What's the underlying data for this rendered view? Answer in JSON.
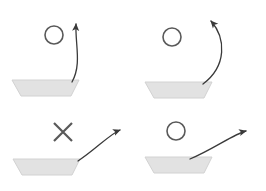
{
  "figure": {
    "title": "",
    "background_color": "#ffffff",
    "width": 266,
    "height": 191,
    "layout": "2x2-grid",
    "panel_count": 4
  },
  "style": {
    "bowl_fill": "#e2e2e2",
    "bowl_edge": "#d2d2d2",
    "circle_stroke": "#595959",
    "cross_stroke": "#595959",
    "arrow_stroke": "#3a3a3a",
    "arrow_width": 1.3,
    "circle_width": 1.6,
    "cross_width": 2.2
  },
  "panels": [
    {
      "id": "panel-top-left",
      "position": "top-left",
      "marker": {
        "type": "circle",
        "name": "circle-marker",
        "cx": 54,
        "cy": 35,
        "r": 9
      },
      "bowl": {
        "name": "bowl-trapezoid",
        "top_left_x": 12,
        "top_right_x": 79,
        "bottom_left_x": 21,
        "bottom_right_x": 71,
        "top_y": 80,
        "bottom_y": 96
      },
      "arrow": {
        "name": "trajectory-arrow",
        "shape": "near-vertical-hook",
        "path": "M 72 82 C 82 64 75 44 76 24",
        "head_x": 76,
        "head_y": 16,
        "head_angle": -86
      }
    },
    {
      "id": "panel-top-right",
      "position": "top-right",
      "marker": {
        "type": "circle",
        "name": "circle-marker",
        "cx": 172,
        "cy": 37,
        "r": 9
      },
      "bowl": {
        "name": "bowl-trapezoid",
        "top_left_x": 145,
        "top_right_x": 212,
        "bottom_left_x": 154,
        "bottom_right_x": 204,
        "top_y": 82,
        "bottom_y": 98
      },
      "arrow": {
        "name": "trajectory-arrow",
        "shape": "wide-arc-left",
        "path": "M 203 84 C 227 66 226 38 211 21",
        "head_x": 207,
        "head_y": 16,
        "head_angle": -135
      }
    },
    {
      "id": "panel-bottom-left",
      "position": "bottom-left",
      "marker": {
        "type": "cross",
        "name": "cross-marker",
        "cx": 63,
        "cy": 132,
        "size": 9
      },
      "bowl": {
        "name": "bowl-trapezoid",
        "top_left_x": 13,
        "top_right_x": 80,
        "bottom_left_x": 22,
        "bottom_right_x": 72,
        "top_y": 159,
        "bottom_y": 175
      },
      "arrow": {
        "name": "trajectory-arrow",
        "shape": "low-arc-right",
        "path": "M 78 161 C 95 150 110 134 120 130",
        "head_x": 127,
        "head_y": 129,
        "head_angle": -10
      }
    },
    {
      "id": "panel-bottom-right",
      "position": "bottom-right",
      "marker": {
        "type": "circle",
        "name": "circle-marker",
        "cx": 176,
        "cy": 131,
        "r": 9
      },
      "bowl": {
        "name": "bowl-trapezoid",
        "top_left_x": 145,
        "top_right_x": 212,
        "bottom_left_x": 154,
        "bottom_right_x": 204,
        "top_y": 157,
        "bottom_y": 173
      },
      "arrow": {
        "name": "trajectory-arrow",
        "shape": "long-arc-right",
        "path": "M 190 159 C 212 150 234 134 246 131",
        "head_x": 254,
        "head_y": 130,
        "head_angle": -8
      }
    }
  ]
}
